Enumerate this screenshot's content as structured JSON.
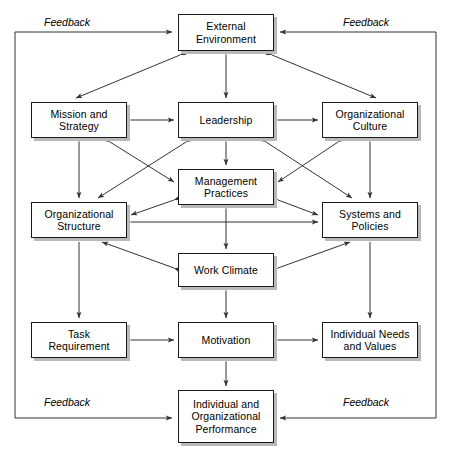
{
  "diagram": {
    "type": "causal-loop-block-diagram",
    "background_color": "#ffffff",
    "box_border_color": "#1a1a1a",
    "box_fill_color": "#ffffff",
    "box_shadow_color": "#b9b9b9",
    "line_color": "#333333",
    "nodes": [
      {
        "id": "external-environment",
        "label": "External\nEnvironment",
        "lines": [
          "External",
          "Environment"
        ],
        "x": 178,
        "y": 14,
        "w": 96,
        "h": 37
      },
      {
        "id": "mission-and-strategy",
        "label": "Mission and\nStrategy",
        "lines": [
          "Mission and",
          "Strategy"
        ],
        "x": 31,
        "y": 102,
        "w": 96,
        "h": 36
      },
      {
        "id": "leadership",
        "label": "Leadership",
        "lines": [
          "Leadership"
        ],
        "x": 178,
        "y": 102,
        "w": 96,
        "h": 36
      },
      {
        "id": "organizational-culture",
        "label": "Organizational\nCulture",
        "lines": [
          "Organizational",
          "Culture"
        ],
        "x": 322,
        "y": 102,
        "w": 96,
        "h": 36
      },
      {
        "id": "management-practices",
        "label": "Management\nPractices",
        "lines": [
          "Management",
          "Practices"
        ],
        "x": 178,
        "y": 169,
        "w": 96,
        "h": 36
      },
      {
        "id": "organizational-structure",
        "label": "Organizational\nStructure",
        "lines": [
          "Organizational",
          "Structure"
        ],
        "x": 31,
        "y": 202,
        "w": 96,
        "h": 36
      },
      {
        "id": "systems-and-policies",
        "label": "Systems and\nPolicies",
        "lines": [
          "Systems and",
          "Policies"
        ],
        "x": 322,
        "y": 202,
        "w": 96,
        "h": 36
      },
      {
        "id": "work-climate",
        "label": "Work Climate",
        "lines": [
          "Work Climate"
        ],
        "x": 178,
        "y": 253,
        "w": 96,
        "h": 34
      },
      {
        "id": "task-requirement",
        "label": "Task\nRequirement",
        "lines": [
          "Task",
          "Requirement"
        ],
        "x": 31,
        "y": 322,
        "w": 96,
        "h": 36
      },
      {
        "id": "motivation",
        "label": "Motivation",
        "lines": [
          "Motivation"
        ],
        "x": 178,
        "y": 322,
        "w": 96,
        "h": 36
      },
      {
        "id": "individual-needs-and-values",
        "label": "Individual Needs\nand Values",
        "lines": [
          "Individual Needs",
          "and Values"
        ],
        "x": 322,
        "y": 322,
        "w": 96,
        "h": 36
      },
      {
        "id": "individual-and-organizational-performance",
        "label": "Individual and\nOrganizational\nPerformance",
        "lines": [
          "Individual and",
          "Organizational",
          "Performance"
        ],
        "x": 178,
        "y": 390,
        "w": 96,
        "h": 53
      }
    ],
    "feedback_labels": [
      {
        "id": "feedback-top-left",
        "text": "Feedback",
        "x": 44,
        "y": 16
      },
      {
        "id": "feedback-top-right",
        "text": "Feedback",
        "x": 343,
        "y": 16
      },
      {
        "id": "feedback-bottom-left",
        "text": "Feedback",
        "x": 44,
        "y": 396
      },
      {
        "id": "feedback-bottom-right",
        "text": "Feedback",
        "x": 343,
        "y": 396
      }
    ],
    "feedback_loops": [
      {
        "id": "feedback-loop-upper-left",
        "description": "Left outer loop feeding External Environment"
      },
      {
        "id": "feedback-loop-upper-right",
        "description": "Right outer loop feeding External Environment"
      },
      {
        "id": "feedback-loop-lower-left",
        "description": "Left outer loop feeding Individual and Organizational Performance"
      },
      {
        "id": "feedback-loop-lower-right",
        "description": "Right outer loop feeding Individual and Organizational Performance"
      }
    ]
  }
}
